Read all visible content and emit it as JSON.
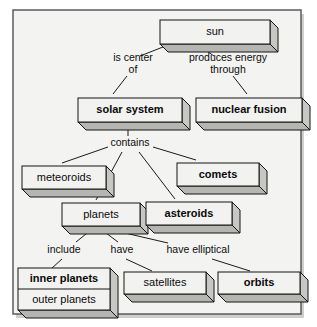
{
  "diagram": {
    "type": "concept-map",
    "background_color": "#f3f3f1",
    "box_face_color": "#f2f2f0",
    "box_side_color": "#c7c7c4",
    "border_color": "#151515",
    "frame": {
      "x": 13,
      "y": 10,
      "width": 288,
      "height": 304
    },
    "nodes": [
      {
        "id": "sun",
        "label": "sun",
        "bold": false,
        "x": 160,
        "y": 20,
        "w": 110,
        "h": 24,
        "depth": 8
      },
      {
        "id": "solar-system",
        "label": "solar system",
        "bold": true,
        "x": 78,
        "y": 98,
        "w": 104,
        "h": 24,
        "depth": 8
      },
      {
        "id": "nuclear-fusion",
        "label": "nuclear fusion",
        "bold": true,
        "x": 196,
        "y": 98,
        "w": 106,
        "h": 24,
        "depth": 8
      },
      {
        "id": "meteoroids",
        "label": "meteoroids",
        "bold": false,
        "x": 22,
        "y": 166,
        "w": 84,
        "h": 23,
        "depth": 8
      },
      {
        "id": "comets",
        "label": "comets",
        "bold": true,
        "x": 177,
        "y": 163,
        "w": 82,
        "h": 23,
        "depth": 8
      },
      {
        "id": "planets",
        "label": "planets",
        "bold": false,
        "x": 62,
        "y": 203,
        "w": 78,
        "h": 23,
        "depth": 8
      },
      {
        "id": "asteroids",
        "label": "asteroids",
        "bold": true,
        "x": 146,
        "y": 202,
        "w": 86,
        "h": 23,
        "depth": 8
      },
      {
        "id": "satellites",
        "label": "satellites",
        "bold": false,
        "x": 124,
        "y": 272,
        "w": 82,
        "h": 22,
        "depth": 8
      },
      {
        "id": "orbits",
        "label": "orbits",
        "bold": true,
        "x": 218,
        "y": 272,
        "w": 82,
        "h": 22,
        "depth": 8
      }
    ],
    "stacked_node": {
      "id": "planets-inner-outer",
      "x": 18,
      "y": 268,
      "w": 92,
      "h": 42,
      "depth": 8,
      "rows": [
        {
          "label": "inner planets",
          "bold": true
        },
        {
          "label": "outer planets",
          "bold": false
        }
      ]
    },
    "link_labels": [
      {
        "id": "is-center-of",
        "lines": [
          "is center",
          "of"
        ],
        "x": 133,
        "y": 64
      },
      {
        "id": "produces-energy",
        "lines": [
          "produces energy",
          "through"
        ],
        "x": 228,
        "y": 64
      },
      {
        "id": "contains",
        "lines": [
          "contains"
        ],
        "x": 130,
        "y": 143
      },
      {
        "id": "include",
        "lines": [
          "include"
        ],
        "x": 64,
        "y": 250
      },
      {
        "id": "have",
        "lines": [
          "have"
        ],
        "x": 122,
        "y": 250
      },
      {
        "id": "have-elliptical",
        "lines": [
          "have elliptical"
        ],
        "x": 198,
        "y": 250
      }
    ],
    "connectors": [
      {
        "id": "sun-to-is-center-of",
        "x1": 163,
        "y1": 47,
        "x2": 140,
        "y2": 56
      },
      {
        "id": "sun-to-produces-energy",
        "x1": 201,
        "y1": 47,
        "x2": 214,
        "y2": 56
      },
      {
        "id": "is-center-of-to-solar",
        "x1": 127,
        "y1": 76,
        "x2": 113,
        "y2": 94
      },
      {
        "id": "produces-to-nuclear",
        "x1": 233,
        "y1": 76,
        "x2": 247,
        "y2": 94
      },
      {
        "id": "solar-to-contains",
        "x1": 128,
        "y1": 125,
        "x2": 128,
        "y2": 136
      },
      {
        "id": "contains-to-meteoroids",
        "x1": 108,
        "y1": 147,
        "x2": 62,
        "y2": 163
      },
      {
        "id": "contains-to-planets",
        "x1": 122,
        "y1": 152,
        "x2": 96,
        "y2": 200
      },
      {
        "id": "contains-to-asteroids",
        "x1": 139,
        "y1": 152,
        "x2": 175,
        "y2": 199
      },
      {
        "id": "contains-to-comets",
        "x1": 153,
        "y1": 147,
        "x2": 196,
        "y2": 160
      },
      {
        "id": "planets-to-include",
        "x1": 91,
        "y1": 230,
        "x2": 76,
        "y2": 242
      },
      {
        "id": "planets-to-have",
        "x1": 102,
        "y1": 230,
        "x2": 118,
        "y2": 242
      },
      {
        "id": "planets-to-have-elliptical",
        "x1": 112,
        "y1": 230,
        "x2": 168,
        "y2": 243
      },
      {
        "id": "include-to-inner-planets",
        "x1": 62,
        "y1": 259,
        "x2": 52,
        "y2": 268
      },
      {
        "id": "have-to-satellites",
        "x1": 126,
        "y1": 259,
        "x2": 152,
        "y2": 271
      },
      {
        "id": "have-elliptical-to-orbits",
        "x1": 212,
        "y1": 259,
        "x2": 250,
        "y2": 271
      }
    ]
  }
}
